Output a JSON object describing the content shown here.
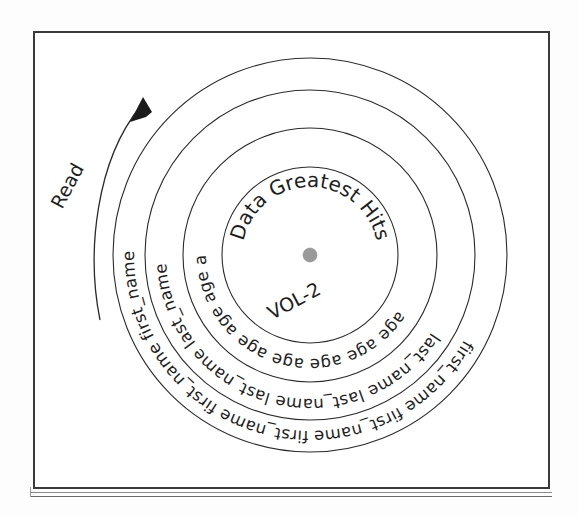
{
  "figure": {
    "title_center": "Data Greatest Hits",
    "volume_label": "VOL-2",
    "read_label": "Read",
    "rings": [
      {
        "name": "first_name_ring",
        "token": "first_name",
        "repeat": 13,
        "radius": 176
      },
      {
        "name": "last_name_ring",
        "token": "last_name",
        "repeat": 11,
        "radius": 144
      },
      {
        "name": "age_ring",
        "token": "age",
        "repeat": 22,
        "radius": 104
      }
    ],
    "circle_radii": [
      197,
      165,
      127,
      88
    ],
    "center": {
      "x": 310,
      "y": 255
    },
    "spindle_radius": 7,
    "colors": {
      "ink": "#1d1d1d",
      "line": "#2b2b2b",
      "frame": "#3a3a3a",
      "spindle": "#9a9a9a",
      "background": "#ffffff"
    },
    "ring_strings": {
      "first_name": "first_name first_name first_name first_name first_name first_name first_name first_name first_name first_name first_name first_name first_name first_name",
      "last_name": "last_name last_name last_name last_name last_name last_name last_name last_name last_name last_name last_name last_name",
      "age": "age age age age age age age age age age age age age age age age age age age age age age age age age"
    }
  }
}
